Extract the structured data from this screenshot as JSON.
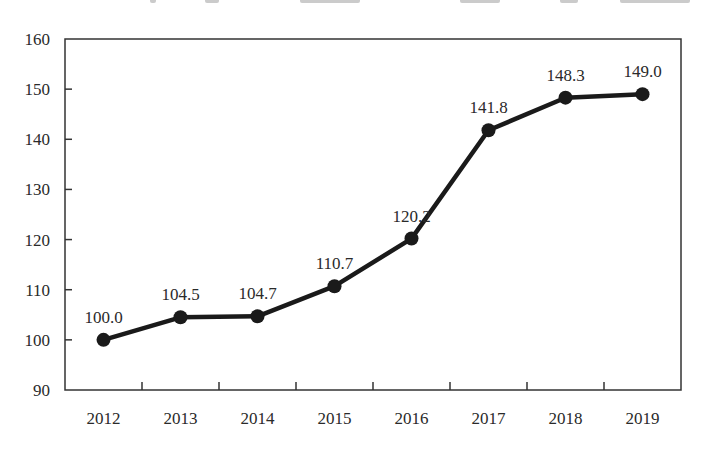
{
  "chart_data": {
    "type": "line",
    "title": "",
    "xlabel": "",
    "ylabel": "",
    "categories": [
      "2012",
      "2013",
      "2014",
      "2015",
      "2016",
      "2017",
      "2018",
      "2019"
    ],
    "series": [
      {
        "name": "Index",
        "values": [
          100.0,
          104.5,
          104.7,
          110.7,
          120.2,
          141.8,
          148.3,
          149.0
        ],
        "labels": [
          "100.0",
          "104.5",
          "104.7",
          "110.7",
          "120.2",
          "141.8",
          "148.3",
          "149.0"
        ],
        "color": "#1a1a1a",
        "marker": "circle"
      }
    ],
    "ylim": [
      90,
      160
    ],
    "yticks": [
      90,
      100,
      110,
      120,
      130,
      140,
      150,
      160
    ],
    "ytick_labels": [
      "90",
      "100",
      "110",
      "120",
      "130",
      "140",
      "150",
      "160"
    ],
    "grid": false,
    "legend": "none",
    "data_labels": true,
    "frame": "box"
  },
  "colors": {
    "background": "#ffffff",
    "line": "#1a1a1a",
    "axis": "#333333",
    "text": "#2a2a2a"
  }
}
